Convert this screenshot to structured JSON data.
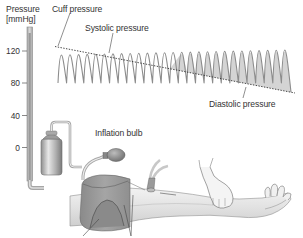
{
  "diagram": {
    "axis": {
      "label_line1": "Pressure",
      "label_line2": "[mmHg]",
      "ticks": [
        {
          "label": "120",
          "value": 120
        },
        {
          "label": "80",
          "value": 80
        },
        {
          "label": "40",
          "value": 40
        },
        {
          "label": "0",
          "value": 0
        }
      ]
    },
    "labels": {
      "cuff_pressure": "Cuff pressure",
      "systolic_pressure": "Systolic pressure",
      "diastolic_pressure": "Diastolic pressure",
      "inflation_bulb": "Inflation bulb"
    },
    "waveform": {
      "oscillation_count": 27,
      "cuff_line_style": "dotted",
      "fill_color": "#d2d2d2",
      "stroke_color": "#8c8c8c"
    },
    "colors": {
      "manometer": "#b9b9b9",
      "cuff": "#8f8f8f",
      "arm": "#e3e3e3",
      "line": "#333333"
    }
  }
}
